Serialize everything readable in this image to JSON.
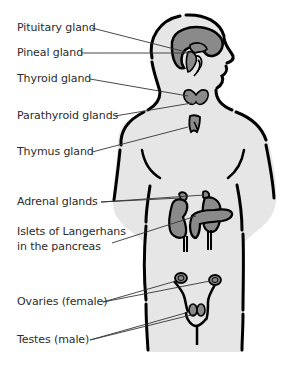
{
  "diagram": {
    "colors": {
      "background": "#ffffff",
      "body_fill": "#e6e6e6",
      "outline": "#000000",
      "organ_fill": "#8a8a8a",
      "leader_line": "#333333",
      "label_text": "#2b2b2b"
    },
    "labels": [
      {
        "id": "pituitary",
        "text": "Pituitary gland"
      },
      {
        "id": "pineal",
        "text": "Pineal gland"
      },
      {
        "id": "thyroid",
        "text": "Thyroid gland"
      },
      {
        "id": "parathyroid",
        "text": "Parathyroid glands"
      },
      {
        "id": "thymus",
        "text": "Thymus gland"
      },
      {
        "id": "adrenal",
        "text": "Adrenal glands"
      },
      {
        "id": "islets",
        "line1": "Islets of Langerhans",
        "line2": "in the pancreas"
      },
      {
        "id": "ovaries",
        "text": "Ovaries (female)"
      },
      {
        "id": "testes",
        "text": "Testes (male)"
      }
    ]
  }
}
